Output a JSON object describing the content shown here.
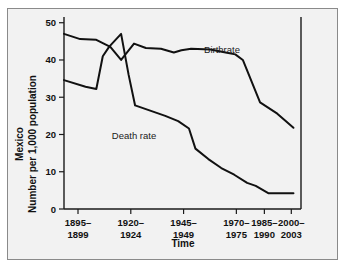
{
  "chart_data": {
    "type": "line",
    "title": "",
    "xlabel": "Time",
    "ylabel_line1": "Mexico",
    "ylabel_line2": "Number per 1,000 population",
    "categories": [
      "1895–\n1899",
      "1920–\n1924",
      "1945–\n1949",
      "1970–\n1975",
      "1985–\n1990",
      "2000–\n2003"
    ],
    "xtick_labels": [
      {
        "top": "1895–",
        "bottom": "1899"
      },
      {
        "top": "1920–",
        "bottom": "1924"
      },
      {
        "top": "1945–",
        "bottom": "1949"
      },
      {
        "top": "1970–",
        "bottom": "1975"
      },
      {
        "top": "1985–",
        "bottom": "1990"
      },
      {
        "top": "2000–",
        "bottom": "2003"
      }
    ],
    "ytick_labels": [
      "0",
      "10",
      "20",
      "30",
      "40",
      "50"
    ],
    "ytick_values": [
      0,
      10,
      20,
      30,
      40,
      50
    ],
    "ylim": [
      0,
      51
    ],
    "xlim": [
      0,
      22
    ],
    "grid": false,
    "legend_position": "inline-annotation",
    "series": [
      {
        "name": "Birthrate",
        "label_text": "Birthrate",
        "points": [
          {
            "x": 0.0,
            "y": 47.0
          },
          {
            "x": 1.5,
            "y": 45.6
          },
          {
            "x": 3.0,
            "y": 45.4
          },
          {
            "x": 4.3,
            "y": 43.5
          },
          {
            "x": 5.3,
            "y": 40.0
          },
          {
            "x": 6.5,
            "y": 44.4
          },
          {
            "x": 7.6,
            "y": 43.2
          },
          {
            "x": 9.0,
            "y": 43.0
          },
          {
            "x": 10.2,
            "y": 42.0
          },
          {
            "x": 10.9,
            "y": 42.6
          },
          {
            "x": 11.8,
            "y": 43.0
          },
          {
            "x": 13.6,
            "y": 42.8
          },
          {
            "x": 15.0,
            "y": 42.0
          },
          {
            "x": 15.9,
            "y": 41.5
          },
          {
            "x": 16.6,
            "y": 40.0
          },
          {
            "x": 18.2,
            "y": 28.6
          },
          {
            "x": 19.8,
            "y": 25.6
          },
          {
            "x": 21.3,
            "y": 21.8
          }
        ]
      },
      {
        "name": "Death rate",
        "label_text": "Death rate",
        "points": [
          {
            "x": 0.0,
            "y": 34.6
          },
          {
            "x": 2.0,
            "y": 32.8
          },
          {
            "x": 3.0,
            "y": 32.2
          },
          {
            "x": 3.6,
            "y": 41.0
          },
          {
            "x": 4.2,
            "y": 43.6
          },
          {
            "x": 5.3,
            "y": 47.0
          },
          {
            "x": 6.0,
            "y": 36.0
          },
          {
            "x": 6.6,
            "y": 27.8
          },
          {
            "x": 8.0,
            "y": 26.4
          },
          {
            "x": 9.4,
            "y": 25.0
          },
          {
            "x": 10.6,
            "y": 23.6
          },
          {
            "x": 11.6,
            "y": 21.6
          },
          {
            "x": 12.2,
            "y": 16.2
          },
          {
            "x": 13.4,
            "y": 13.4
          },
          {
            "x": 14.6,
            "y": 11.0
          },
          {
            "x": 15.8,
            "y": 9.2
          },
          {
            "x": 17.0,
            "y": 7.0
          },
          {
            "x": 17.8,
            "y": 6.2
          },
          {
            "x": 19.0,
            "y": 4.2
          },
          {
            "x": 21.3,
            "y": 4.2
          }
        ]
      }
    ]
  }
}
